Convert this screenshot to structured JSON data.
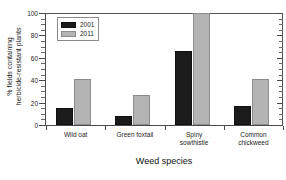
{
  "chart_data": {
    "type": "bar",
    "title": "",
    "xlabel": "Weed species",
    "ylabel_line1": "% fields containing",
    "ylabel_line2": "herbicide-resistant plants",
    "categories": [
      "Wild oat",
      "Green foxtail",
      "Spiny sowthistle",
      "Common chickweed"
    ],
    "category_lines": [
      [
        "Wild oat"
      ],
      [
        "Green foxtail"
      ],
      [
        "Spiny",
        "sowthistle"
      ],
      [
        "Common",
        "chickweed"
      ]
    ],
    "series": [
      {
        "name": "2001",
        "color": "#1b1b1b",
        "values": [
          15,
          8,
          66,
          17
        ]
      },
      {
        "name": "2011",
        "color": "#b4b4b4",
        "values": [
          41,
          27,
          100,
          41
        ]
      }
    ],
    "ylim": [
      0,
      100
    ],
    "yticks": [
      0,
      20,
      40,
      60,
      80,
      100
    ],
    "ytick_labels": [
      "0",
      "20",
      "40",
      "60",
      "80",
      "100"
    ],
    "grid": false,
    "legend_position": "upper-left-inside"
  },
  "legend": {
    "entries": [
      {
        "label": "2001"
      },
      {
        "label": "2011"
      }
    ]
  }
}
